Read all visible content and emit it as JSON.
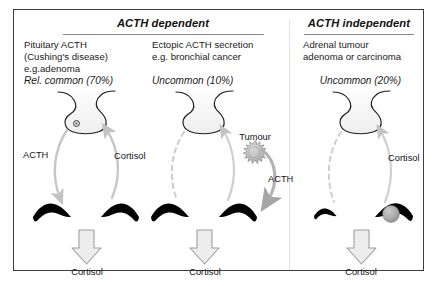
{
  "figure": {
    "title_left": "ACTH dependent",
    "title_right": "ACTH independent"
  },
  "columns": [
    {
      "id": "pituitary-acth",
      "group": "ACTH dependent",
      "description_lines": [
        "Pituitary ACTH",
        "(Cushing's disease)",
        "e.g.adenoma"
      ],
      "prevalence": "Rel. common (70%)",
      "gland_label": "",
      "arrow_labels": {
        "up": "ACTH",
        "down": "Cortisol"
      },
      "output_label": "Cortisol"
    },
    {
      "id": "ectopic-acth",
      "group": "ACTH dependent",
      "description_lines": [
        "Ectopic ACTH secretion",
        "e.g. bronchial cancer"
      ],
      "prevalence": "Uncommon (10%)",
      "gland_label": "Tumour",
      "arrow_labels": {
        "up": "",
        "down": "",
        "tumour_to_adrenal": "ACTH"
      },
      "output_label": "Cortisol"
    },
    {
      "id": "adrenal-tumour",
      "group": "ACTH independent",
      "description_lines": [
        "Adrenal tumour",
        "adenoma or carcinoma"
      ],
      "prevalence": "Uncommon (20%)",
      "gland_label": "",
      "arrow_labels": {
        "up": "",
        "down": "Cortisol"
      },
      "output_label": "Cortisol"
    }
  ],
  "colors": {
    "border": "#3d3d3d",
    "rule": "#8a8a8a",
    "text": "#1a1a1a",
    "adrenal": "#000000",
    "arrow_gray": "#bfbfbf",
    "arrow_gray_dark": "#a8a8a8",
    "block_arrow_fill": "#e9e9e9",
    "block_arrow_stroke": "#9a9a9a",
    "tumour_fill": "#b9b9b9",
    "tumour_stroke": "#8f8f8f",
    "gland_stroke": "#1e1e1e",
    "gland_fill": "#f1f1f1"
  }
}
